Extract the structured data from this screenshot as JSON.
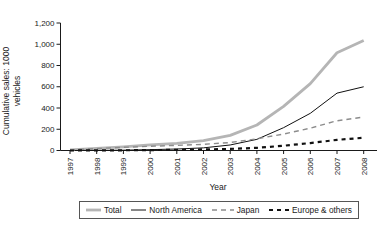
{
  "figure": {
    "y_axis_label_line1": "Cumulative sales: 1000",
    "y_axis_label_line2": "vehicles",
    "x_axis_label": "Year"
  },
  "chart_data": {
    "type": "line",
    "title": "",
    "xlabel": "Year",
    "ylabel": "Cumulative sales: 1000 vehicles",
    "x": [
      1997,
      1998,
      1999,
      2000,
      2001,
      2002,
      2003,
      2004,
      2005,
      2006,
      2007,
      2008
    ],
    "x_labels": [
      "1997",
      "1998",
      "1999",
      "2000",
      "2001",
      "2002",
      "2003",
      "2004",
      "2005",
      "2006",
      "2007",
      "2008"
    ],
    "y_ticks": [
      0,
      200,
      400,
      600,
      800,
      1000,
      1200
    ],
    "y_tick_labels": [
      "0",
      "200",
      "400",
      "600",
      "800",
      "1,000",
      "1,200"
    ],
    "ylim": [
      0,
      1200
    ],
    "grid": false,
    "legend_position": "bottom",
    "series": [
      {
        "name": "Total",
        "color": "#b5b5b5",
        "stroke_width": 2.8,
        "dash": "",
        "sample_width": 15,
        "values": [
          5,
          20,
          35,
          52,
          68,
          93,
          142,
          240,
          415,
          630,
          920,
          1035
        ]
      },
      {
        "name": "North America",
        "color": "#111111",
        "stroke_width": 1,
        "dash": "",
        "sample_width": 15,
        "values": [
          0,
          1,
          3,
          8,
          14,
          25,
          52,
          105,
          215,
          350,
          540,
          600
        ]
      },
      {
        "name": "Japan",
        "color": "#8c8c8c",
        "stroke_width": 1.4,
        "dash": "5,4",
        "sample_width": 22,
        "values": [
          5,
          18,
          30,
          40,
          48,
          58,
          75,
          110,
          155,
          210,
          280,
          315
        ]
      },
      {
        "name": "Europe & others",
        "color": "#111111",
        "stroke_width": 2.2,
        "dash": "4,4",
        "sample_width": 20,
        "values": [
          0,
          1,
          2,
          4,
          6,
          10,
          15,
          25,
          45,
          70,
          100,
          120
        ]
      }
    ]
  },
  "colors": {
    "background": "#ffffff",
    "axis": "#1a1a1a",
    "text": "#1a1a1a",
    "legend_border": "#555555"
  }
}
